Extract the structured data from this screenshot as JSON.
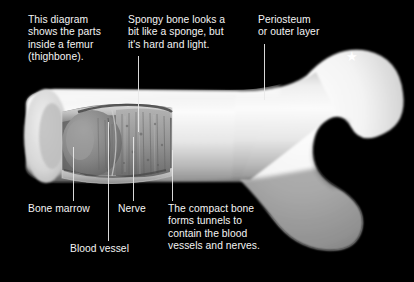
{
  "diagram": {
    "title": "Parts inside a femur (thighbone)",
    "background_color": "#000000",
    "text_color": "#f4f4f4",
    "bone_color": "#f2f2f2",
    "bone_shadow_color": "#8a8a8a",
    "marrow_color": "#7c7c7c",
    "spongy_color": "#9a9a9a"
  },
  "captions": {
    "intro": "This diagram\nshows the parts\ninside a femur\n(thighbone).",
    "spongy_bone": "Spongy bone looks a\nbit like a sponge, but\nit's hard and light.",
    "periosteum": "Periosteum\nor outer layer",
    "bone_marrow": "Bone marrow",
    "nerve": "Nerve",
    "blood_vessel": "Blood vessel",
    "compact_bone": "The compact bone\nforms tunnels to\ncontain the blood\nvessels and nerves."
  },
  "marker": {
    "star_glyph": "★"
  }
}
